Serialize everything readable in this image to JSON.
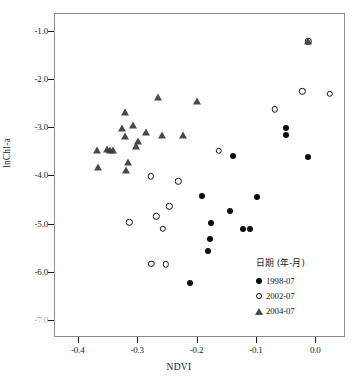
{
  "chart_data": {
    "type": "scatter",
    "title": "",
    "xlabel": "NDVI",
    "ylabel": "lnChl-a",
    "xlim": [
      -0.44,
      0.05
    ],
    "ylim": [
      -7.35,
      -0.63
    ],
    "grid": false,
    "legend_position": "bottom-right",
    "legend_title": "日期 (年-月)",
    "xticks": [
      "-0.4",
      "-0.3",
      "-0.2",
      "-0.1",
      "0.0"
    ],
    "xtick_values": [
      -0.4,
      -0.3,
      -0.2,
      -0.1,
      0.0
    ],
    "yticks": [
      "-1.0",
      "-2.0",
      "-3.0",
      "-4.0",
      "-5.0",
      "-6.0",
      "-7.0"
    ],
    "ytick_values": [
      -1.0,
      -2.0,
      -3.0,
      -4.0,
      -5.0,
      -6.0,
      -7.0
    ],
    "ytick_faded_index": 6,
    "series": [
      {
        "name": "1998-07",
        "marker": "filled-circle",
        "color": "#0b0b0b",
        "points": [
          [
            -0.138,
            -3.6
          ],
          [
            -0.049,
            -3.02
          ],
          [
            -0.049,
            -3.17
          ],
          [
            -0.012,
            -3.62
          ],
          [
            -0.19,
            -4.43
          ],
          [
            -0.098,
            -4.44
          ],
          [
            -0.144,
            -4.74
          ],
          [
            -0.176,
            -4.98
          ],
          [
            -0.122,
            -5.12
          ],
          [
            -0.11,
            -5.12
          ],
          [
            -0.178,
            -5.31
          ],
          [
            -0.18,
            -5.56
          ],
          [
            -0.211,
            -6.22
          ]
        ]
      },
      {
        "name": "2002-07",
        "marker": "open-circle",
        "color": "#141414",
        "points": [
          [
            -0.012,
            -1.22
          ],
          [
            -0.022,
            -2.25
          ],
          [
            0.024,
            -2.3
          ],
          [
            -0.068,
            -2.63
          ],
          [
            -0.163,
            -3.49
          ],
          [
            -0.277,
            -4.02
          ],
          [
            -0.231,
            -4.12
          ],
          [
            -0.246,
            -4.64
          ],
          [
            -0.268,
            -4.85
          ],
          [
            -0.313,
            -4.97
          ],
          [
            -0.257,
            -5.11
          ],
          [
            -0.276,
            -5.83
          ],
          [
            -0.252,
            -5.84
          ]
        ]
      },
      {
        "name": "2004-07",
        "marker": "triangle",
        "color": "#3a3a3a",
        "points": [
          [
            -0.012,
            -1.22
          ],
          [
            -0.265,
            -2.38
          ],
          [
            -0.199,
            -2.45
          ],
          [
            -0.321,
            -2.69
          ],
          [
            -0.307,
            -2.96
          ],
          [
            -0.325,
            -3.01
          ],
          [
            -0.285,
            -3.1
          ],
          [
            -0.258,
            -3.16
          ],
          [
            -0.222,
            -3.15
          ],
          [
            -0.32,
            -3.19
          ],
          [
            -0.299,
            -3.28
          ],
          [
            -0.302,
            -3.39
          ],
          [
            -0.367,
            -3.47
          ],
          [
            -0.351,
            -3.46
          ],
          [
            -0.345,
            -3.47
          ],
          [
            -0.34,
            -3.47
          ],
          [
            -0.315,
            -3.72
          ],
          [
            -0.318,
            -3.88
          ],
          [
            -0.366,
            -3.82
          ]
        ]
      }
    ]
  },
  "axes": {
    "x_title": "NDVI",
    "y_title": "lnChl-a"
  },
  "legend": {
    "title": "日期 (年-月)",
    "entries": [
      {
        "label": "1998-07",
        "marker": "filled-circle"
      },
      {
        "label": "2002-07",
        "marker": "open-circle"
      },
      {
        "label": "2004-07",
        "marker": "triangle"
      }
    ]
  }
}
